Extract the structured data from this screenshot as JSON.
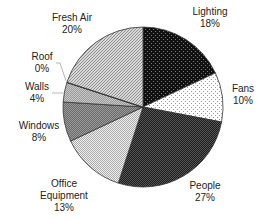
{
  "chart_data": {
    "type": "pie",
    "title": "",
    "start_angle_deg": 0,
    "direction": "clockwise",
    "slices": [
      {
        "label": "Lighting",
        "value": 18,
        "pct_label": "18%",
        "pattern": "black-dots",
        "fill": "#111111",
        "dot": "#777777"
      },
      {
        "label": "Fans",
        "value": 10,
        "pct_label": "10%",
        "pattern": "light-dots",
        "fill": "#ffffff",
        "dot": "#999999"
      },
      {
        "label": "People",
        "value": 27,
        "pct_label": "27%",
        "pattern": "dark-check",
        "fill": "#1c1c1c",
        "dot": "#555555"
      },
      {
        "label": "Office Equipment",
        "value": 13,
        "pct_label": "13%",
        "pattern": "light-check",
        "fill": "#f0f0f0",
        "dot": "#aaaaaa"
      },
      {
        "label": "Windows",
        "value": 8,
        "pct_label": "8%",
        "pattern": "mid-check",
        "fill": "#6a6a6a",
        "dot": "#9a9a9a"
      },
      {
        "label": "Walls",
        "value": 4,
        "pct_label": "4%",
        "pattern": "grey-check",
        "fill": "#9a9a9a",
        "dot": "#c8c8c8"
      },
      {
        "label": "Roof",
        "value": 0,
        "pct_label": "0%",
        "pattern": "none",
        "fill": "#333333",
        "dot": "#333333"
      },
      {
        "label": "Fresh Air",
        "value": 20,
        "pct_label": "20%",
        "pattern": "diag-hatch",
        "fill": "#d8d8d8",
        "dot": "#888888"
      }
    ],
    "legend": "none",
    "labels_outside": true
  },
  "labels": [
    {
      "name": "Lighting",
      "lines": [
        "Lighting",
        "18%"
      ],
      "x": 210,
      "y": 6
    },
    {
      "name": "Fans",
      "lines": [
        "Fans",
        "10%"
      ],
      "x": 243,
      "y": 83
    },
    {
      "name": "People",
      "lines": [
        "People",
        "27%"
      ],
      "x": 205,
      "y": 180
    },
    {
      "name": "Office Equipment",
      "lines": [
        "Office",
        "Equipment",
        "13%"
      ],
      "x": 64,
      "y": 178
    },
    {
      "name": "Windows",
      "lines": [
        "Windows",
        "8%"
      ],
      "x": 39,
      "y": 120
    },
    {
      "name": "Walls",
      "lines": [
        "Walls",
        "4%"
      ],
      "x": 37,
      "y": 81
    },
    {
      "name": "Roof",
      "lines": [
        "Roof",
        "0%"
      ],
      "x": 42,
      "y": 51
    },
    {
      "name": "Fresh Air",
      "lines": [
        "Fresh Air",
        "20%"
      ],
      "x": 72,
      "y": 12
    }
  ],
  "geometry": {
    "cx": 143,
    "cy": 107,
    "r": 80
  }
}
